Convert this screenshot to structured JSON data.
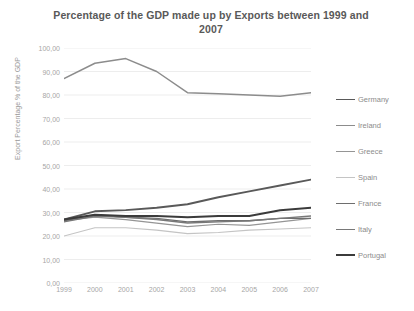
{
  "chart_data": {
    "type": "line",
    "title": "Percentage of the GDP made up by Exports between 1999 and 2007",
    "title_line1": "Percentage of the GDP made up by Exports between 1999",
    "title_line2": "and 2007",
    "xlabel": "",
    "ylabel": "Export Percentage % of the GDP",
    "x": [
      1999,
      2000,
      2001,
      2002,
      2003,
      2004,
      2005,
      2006,
      2007
    ],
    "categories": [
      "1999",
      "2000",
      "2001",
      "2002",
      "2003",
      "2004",
      "2005",
      "2006",
      "2007"
    ],
    "ylim": [
      0,
      100
    ],
    "ytick_labels": [
      "100,00",
      "90,00",
      "80,00",
      "70,00",
      "60,00",
      "50,00",
      "40,00",
      "30,00",
      "20,00",
      "10,00",
      "0,00"
    ],
    "ytick_values": [
      100,
      90,
      80,
      70,
      60,
      50,
      40,
      30,
      20,
      10,
      0
    ],
    "grid": true,
    "legend_position": "right",
    "series": [
      {
        "name": "Germany",
        "color": "#595959",
        "width": 1.9,
        "values": [
          27.0,
          30.5,
          31.0,
          32.0,
          33.5,
          36.5,
          39.0,
          41.5,
          44.0
        ]
      },
      {
        "name": "Ireland",
        "color": "#8c8c8c",
        "width": 1.5,
        "values": [
          87.0,
          93.5,
          95.5,
          90.0,
          81.0,
          80.5,
          80.0,
          79.5,
          81.0
        ]
      },
      {
        "name": "Greece",
        "color": "#959595",
        "width": 1.2,
        "values": [
          26.5,
          28.0,
          27.0,
          25.5,
          24.0,
          25.0,
          24.5,
          26.0,
          27.5
        ]
      },
      {
        "name": "Spain",
        "color": "#c4c4c4",
        "width": 1.1,
        "values": [
          20.0,
          23.5,
          23.5,
          22.5,
          21.0,
          21.5,
          22.5,
          23.0,
          23.5
        ]
      },
      {
        "name": "France",
        "color": "#6e6e6e",
        "width": 1.4,
        "values": [
          26.5,
          29.0,
          28.0,
          27.5,
          26.0,
          26.5,
          26.5,
          27.5,
          27.5
        ]
      },
      {
        "name": "Italy",
        "color": "#787878",
        "width": 1.4,
        "values": [
          26.0,
          28.5,
          28.0,
          27.0,
          25.5,
          26.0,
          26.5,
          27.5,
          28.5
        ]
      },
      {
        "name": "Portugal",
        "color": "#3b3b3b",
        "width": 2.0,
        "values": [
          27.0,
          29.0,
          28.5,
          28.5,
          28.0,
          28.5,
          28.5,
          31.0,
          32.0
        ]
      }
    ]
  }
}
